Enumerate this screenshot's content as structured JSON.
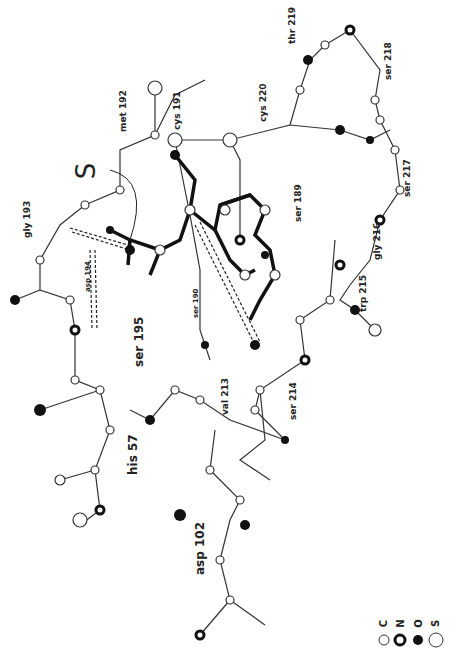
{
  "figure": {
    "type": "ball-and-stick molecular model (rotated 90°)",
    "marker": "S",
    "residue_labels": [
      {
        "id": "gly193",
        "text": "gly 193",
        "x": 22,
        "y": 238
      },
      {
        "id": "met192",
        "text": "met 192",
        "x": 122,
        "y": 132
      },
      {
        "id": "cys191",
        "text": "cys 191",
        "x": 180,
        "y": 130
      },
      {
        "id": "cys220",
        "text": "cys 220",
        "x": 262,
        "y": 122
      },
      {
        "id": "thr219",
        "text": "thr 219",
        "x": 293,
        "y": 44
      },
      {
        "id": "ser218",
        "text": "ser 218",
        "x": 383,
        "y": 80
      },
      {
        "id": "ser217",
        "text": "ser 217",
        "x": 404,
        "y": 197
      },
      {
        "id": "ser189",
        "text": "ser 189",
        "x": 300,
        "y": 222
      },
      {
        "id": "gly216",
        "text": "gly 216",
        "x": 374,
        "y": 270
      },
      {
        "id": "trp215",
        "text": "trp 215",
        "x": 358,
        "y": 314
      },
      {
        "id": "asp194",
        "text": "asp 194",
        "x": 87,
        "y": 292
      },
      {
        "id": "ser190",
        "text": "ser 190",
        "x": 196,
        "y": 313
      },
      {
        "id": "ser195",
        "text": "ser 195",
        "x": 135,
        "y": 367
      },
      {
        "id": "val213",
        "text": "val 213",
        "x": 224,
        "y": 415
      },
      {
        "id": "ser214",
        "text": "ser 214",
        "x": 290,
        "y": 420
      },
      {
        "id": "his57",
        "text": "his 57",
        "x": 130,
        "y": 475
      },
      {
        "id": "asp102",
        "text": "asp 102",
        "x": 196,
        "y": 575
      }
    ],
    "legend": [
      {
        "symbol": "C",
        "style": "open"
      },
      {
        "symbol": "N",
        "style": "thick-ring"
      },
      {
        "symbol": "O",
        "style": "filled"
      },
      {
        "symbol": "S",
        "style": "large-open"
      }
    ]
  }
}
